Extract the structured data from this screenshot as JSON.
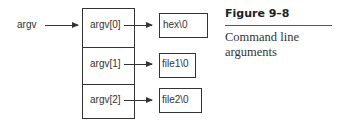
{
  "diagram": {
    "pointer_label": "argv",
    "array_cells": [
      {
        "label": "argv[0]",
        "target": "hex\\0"
      },
      {
        "label": "argv[1]",
        "target": "file1\\0"
      },
      {
        "label": "argv[2]",
        "target": "file2\\0"
      }
    ]
  },
  "figure": {
    "title": "Figure 9–8",
    "caption": "Command line arguments"
  },
  "colors": {
    "stroke": "#333333",
    "text": "#333333",
    "background": "#ffffff"
  }
}
